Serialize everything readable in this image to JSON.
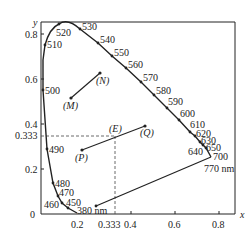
{
  "diagram": {
    "type": "CIE chromaticity diagram",
    "axes": {
      "x_label": "x",
      "y_label": "y",
      "x_ticks": [
        "0.2",
        "0.333",
        "0.4",
        "0.6",
        "0.8"
      ],
      "y_ticks": [
        "0.8",
        "0.6",
        "0.4",
        "0.333",
        "0.2"
      ],
      "origin_label": "0"
    },
    "wavelengths": [
      "380 nm",
      "450",
      "460",
      "470",
      "480",
      "490",
      "500",
      "510",
      "520",
      "530",
      "540",
      "550",
      "560",
      "570",
      "580",
      "590",
      "600",
      "610",
      "620",
      "630",
      "640",
      "650",
      "700",
      "770 nm"
    ],
    "points": {
      "E": "(E)",
      "M": "(M)",
      "N": "(N)",
      "P": "(P)",
      "Q": "(Q)"
    },
    "colors": {
      "line": "#222222",
      "dashed": "#444444"
    }
  }
}
